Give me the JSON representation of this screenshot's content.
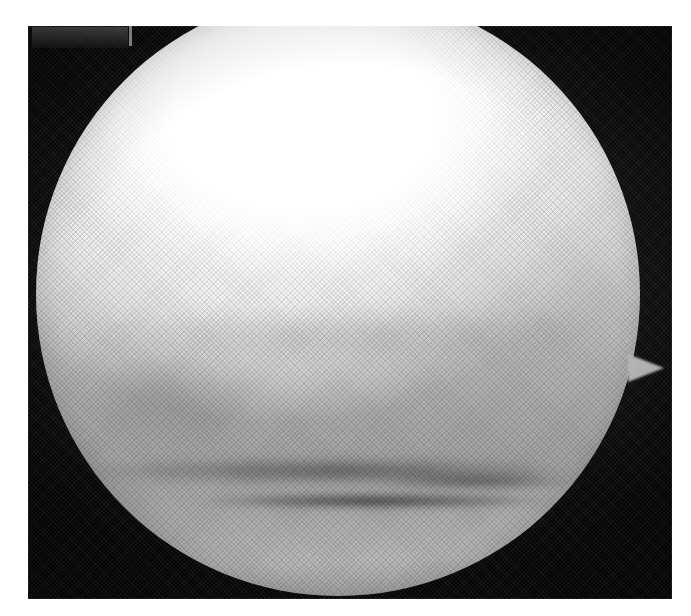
{
  "page": {
    "width": 691,
    "height": 616,
    "background_color": "#ffffff",
    "kind": "scanned-halftone-photograph",
    "caption": ""
  },
  "photo_plate": {
    "name": "scanned photographic plate",
    "x": 28,
    "y": 26,
    "width": 644,
    "height": 573,
    "background_color": "#0b0b0b",
    "texture": "halftone-screen",
    "corner_marker": {
      "description": "faint lighter rectangular marker at upper-left of the plate",
      "x": 4,
      "y": 1,
      "width": 96,
      "height": 21,
      "color": "#767676"
    },
    "corner_marker_tick": {
      "description": "short vertical light tick right of the marker",
      "x": 101,
      "y": 0,
      "width": 3,
      "height": 20,
      "color": "#bebebe"
    }
  },
  "subject": {
    "name": "illuminated sphere",
    "shape": "sphere",
    "center_x": 310,
    "center_y": 268,
    "diameter": 604,
    "highlight": {
      "position": "upper-centre",
      "center_x_pct": 44,
      "center_y_pct": 20,
      "color": "#ffffff"
    },
    "body_colors": {
      "highlight": "#ffffff",
      "upper_body": "#efefef",
      "mid_body": "#c4c4c4",
      "lower_body": "#a4a4a4",
      "limb_shadow": "#8a8a8a"
    },
    "rim_light": {
      "position": "upper-right limb",
      "color": "#ffffff"
    },
    "dark_band": {
      "description": "dark horizontal band / seam across the lower third of the sphere",
      "y_pct": 80,
      "color": "#2a2a2a"
    },
    "protrusion": {
      "description": "small triangular spike on the right limb",
      "x": 600,
      "y": 328,
      "width": 36,
      "height": 28,
      "color": "#b6b6b6"
    }
  }
}
